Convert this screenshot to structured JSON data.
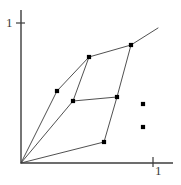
{
  "figure": {
    "title": "",
    "background_color": "#ffffff",
    "stroke_color": "#3c3c3c",
    "point_color": "#000000",
    "width": 181,
    "height": 185
  },
  "axes": {
    "origin": {
      "x": 21,
      "y": 163
    },
    "y_axis": {
      "top_y": 10,
      "x": 21,
      "bottom_y": 163
    },
    "x_axis": {
      "y": 163,
      "left_x": 21,
      "right_x": 173
    },
    "y_tick": {
      "label": "1",
      "x1": 16,
      "x2": 25,
      "y": 23
    },
    "x_tick": {
      "label": "1",
      "y1": 157,
      "y2": 167,
      "x": 153
    }
  },
  "chart_data": {
    "type": "scatter",
    "title": "",
    "xlabel": "",
    "ylabel": "",
    "xlim": [
      0,
      1
    ],
    "ylim": [
      0,
      1
    ],
    "grid": false,
    "legend": null,
    "axis_unit_pixels": {
      "x": 132,
      "y": 140
    },
    "points": [
      {
        "id": "p1",
        "px": 57,
        "py": 91,
        "x": 0.273,
        "y": 0.514,
        "marker": "square",
        "connected": true
      },
      {
        "id": "p2",
        "px": 73,
        "py": 101,
        "x": 0.394,
        "y": 0.443,
        "marker": "square",
        "connected": true
      },
      {
        "id": "p3",
        "px": 89,
        "py": 57,
        "x": 0.515,
        "y": 0.757,
        "marker": "square",
        "connected": true
      },
      {
        "id": "p4",
        "px": 117,
        "py": 97,
        "x": 0.727,
        "y": 0.471,
        "marker": "square",
        "connected": true
      },
      {
        "id": "p5",
        "px": 131,
        "py": 45,
        "x": 0.833,
        "y": 0.843,
        "marker": "square",
        "connected": true
      },
      {
        "id": "p6",
        "px": 104,
        "py": 142,
        "x": 0.629,
        "y": 0.15,
        "marker": "square",
        "connected": true
      },
      {
        "id": "p7",
        "px": 143,
        "py": 104,
        "x": 0.924,
        "y": 0.421,
        "marker": "square",
        "connected": false
      },
      {
        "id": "p8",
        "px": 143,
        "py": 127,
        "x": 0.924,
        "y": 0.257,
        "marker": "square",
        "connected": false
      }
    ],
    "segments": [
      {
        "id": "s1",
        "from": "origin",
        "to": "p1",
        "x1": 21,
        "y1": 163,
        "x2": 57,
        "y2": 91
      },
      {
        "id": "s2",
        "from": "p1",
        "to": "p3",
        "x1": 57,
        "y1": 91,
        "x2": 89,
        "y2": 57
      },
      {
        "id": "s3",
        "from": "origin",
        "to": "p2",
        "x1": 21,
        "y1": 163,
        "x2": 73,
        "y2": 101
      },
      {
        "id": "s4",
        "from": "p2",
        "to": "p3",
        "x1": 73,
        "y1": 101,
        "x2": 89,
        "y2": 57
      },
      {
        "id": "s5",
        "from": "p2",
        "to": "p4",
        "x1": 73,
        "y1": 101,
        "x2": 117,
        "y2": 97
      },
      {
        "id": "s6",
        "from": "p3",
        "to": "p5",
        "x1": 89,
        "y1": 57,
        "x2": 131,
        "y2": 45
      },
      {
        "id": "s7",
        "from": "p5",
        "to": "p4",
        "x1": 131,
        "y1": 45,
        "x2": 117,
        "y2": 97
      },
      {
        "id": "s8",
        "from": "p4",
        "to": "p6",
        "x1": 117,
        "y1": 97,
        "x2": 104,
        "y2": 142
      },
      {
        "id": "s9",
        "from": "origin",
        "to": "p6",
        "x1": 21,
        "y1": 163,
        "x2": 104,
        "y2": 142
      },
      {
        "id": "s10",
        "from": "p5",
        "to": "ray",
        "x1": 131,
        "y1": 45,
        "x2": 158,
        "y2": 28
      }
    ]
  }
}
